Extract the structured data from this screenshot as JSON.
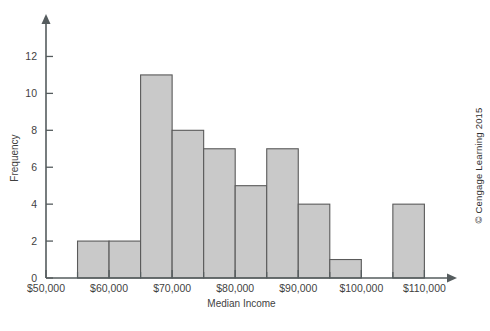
{
  "figure": {
    "credit": "© Cengage Learning 2015",
    "bar_fill": "#c9c9c9",
    "bar_stroke": "#5a5a5a",
    "axis_color": "#555c5e"
  },
  "chart_data": {
    "type": "bar",
    "title": "",
    "xlabel": "Median Income",
    "ylabel": "Frequency",
    "xlim": [
      50000,
      112000
    ],
    "ylim": [
      0,
      13
    ],
    "grid": false,
    "legend": null,
    "bin_width": 5000,
    "x_tick_labels": [
      "$50,000",
      "$60,000",
      "$70,000",
      "$80,000",
      "$90,000",
      "$100,000",
      "$110,000"
    ],
    "x_tick_values": [
      50000,
      60000,
      70000,
      80000,
      90000,
      100000,
      110000
    ],
    "x_minor_tick_values": [
      55000,
      65000,
      75000,
      85000,
      95000,
      105000
    ],
    "y_tick_labels": [
      "0",
      "2",
      "4",
      "6",
      "8",
      "10",
      "12"
    ],
    "y_tick_values": [
      0,
      2,
      4,
      6,
      8,
      10,
      12
    ],
    "bins": [
      {
        "start": 55000,
        "end": 60000,
        "value": 2
      },
      {
        "start": 60000,
        "end": 65000,
        "value": 2
      },
      {
        "start": 65000,
        "end": 70000,
        "value": 11
      },
      {
        "start": 70000,
        "end": 75000,
        "value": 8
      },
      {
        "start": 75000,
        "end": 80000,
        "value": 7
      },
      {
        "start": 80000,
        "end": 85000,
        "value": 5
      },
      {
        "start": 85000,
        "end": 90000,
        "value": 7
      },
      {
        "start": 90000,
        "end": 95000,
        "value": 4
      },
      {
        "start": 95000,
        "end": 100000,
        "value": 1
      },
      {
        "start": 100000,
        "end": 105000,
        "value": 0
      },
      {
        "start": 105000,
        "end": 110000,
        "value": 4
      }
    ],
    "categories": [
      "55-60k",
      "60-65k",
      "65-70k",
      "70-75k",
      "75-80k",
      "80-85k",
      "85-90k",
      "90-95k",
      "95-100k",
      "100-105k",
      "105-110k"
    ],
    "values": [
      2,
      2,
      11,
      8,
      7,
      5,
      7,
      4,
      1,
      0,
      4
    ]
  }
}
